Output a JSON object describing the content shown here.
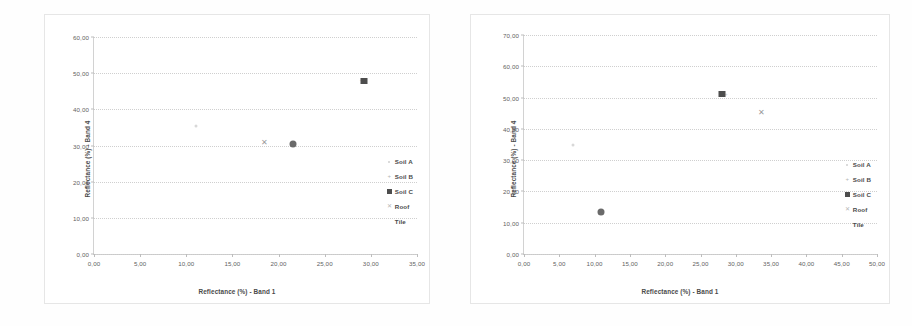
{
  "chart_data": [
    {
      "type": "scatter",
      "id": "left",
      "title": "",
      "xlabel": "Reflectance (%) - Band 1",
      "ylabel": "Reflectance (%) - Band 4",
      "xlim": [
        0,
        35
      ],
      "ylim": [
        0,
        60
      ],
      "xticks": [
        "0,00",
        "5,00",
        "10,00",
        "15,00",
        "20,00",
        "25,00",
        "30,00",
        "35,00"
      ],
      "xtick_values": [
        0,
        5,
        10,
        15,
        20,
        25,
        30,
        35
      ],
      "yticks": [
        "0,00",
        "10,00",
        "20,00",
        "30,00",
        "40,00",
        "50,00",
        "60,00"
      ],
      "ytick_values": [
        0,
        10,
        20,
        30,
        40,
        50,
        60
      ],
      "grid": "horizontal-dotted",
      "legend_position": "right-inside",
      "series": [
        {
          "name": "Soil A",
          "marker": "soil-a",
          "points": [
            [
              11.0,
              35.5
            ]
          ]
        },
        {
          "name": "Soil B",
          "marker": "soil-b",
          "points": [
            [
              29.0,
              48.2
            ]
          ]
        },
        {
          "name": "Soil C",
          "marker": "soil-c",
          "points": [
            [
              29.3,
              47.8
            ]
          ]
        },
        {
          "name": "Roof",
          "marker": "roof",
          "points": [
            [
              18.5,
              31.0
            ]
          ]
        },
        {
          "name": "Tile",
          "marker": "tile",
          "points": [
            [
              21.6,
              30.4
            ]
          ]
        }
      ]
    },
    {
      "type": "scatter",
      "id": "right",
      "title": "",
      "xlabel": "Reflectance (%) - Band 1",
      "ylabel": "Reflectance (%) - Band 4",
      "xlim": [
        0,
        50
      ],
      "ylim": [
        0,
        70
      ],
      "xticks": [
        "0,00",
        "5,00",
        "10,00",
        "15,00",
        "20,00",
        "25,00",
        "30,00",
        "35,00",
        "40,00",
        "45,00",
        "50,00"
      ],
      "xtick_values": [
        0,
        5,
        10,
        15,
        20,
        25,
        30,
        35,
        40,
        45,
        50
      ],
      "yticks": [
        "0,00",
        "10,00",
        "20,00",
        "30,00",
        "40,00",
        "50,00",
        "60,00",
        "70,00"
      ],
      "ytick_values": [
        0,
        10,
        20,
        30,
        40,
        50,
        60,
        70
      ],
      "grid": "horizontal-dotted",
      "legend_position": "right-inside",
      "series": [
        {
          "name": "Soil A",
          "marker": "soil-a",
          "points": [
            [
              7.0,
              35.0
            ]
          ]
        },
        {
          "name": "Soil B",
          "marker": "soil-b",
          "points": [
            [
              28.6,
              51.0
            ]
          ]
        },
        {
          "name": "Soil C",
          "marker": "soil-c",
          "points": [
            [
              28.0,
              51.2
            ]
          ]
        },
        {
          "name": "Roof",
          "marker": "roof",
          "points": [
            [
              33.6,
              45.5
            ]
          ]
        },
        {
          "name": "Tile",
          "marker": "tile",
          "points": [
            [
              10.9,
              13.5
            ]
          ]
        }
      ]
    }
  ],
  "legend_entries": [
    "Soil A",
    "Soil B",
    "Soil C",
    "Roof",
    "Tile"
  ],
  "colors": {
    "soil_a": "#d8d8d8",
    "soil_b": "#cccccc",
    "soil_c": "#4d4d4d",
    "roof": "#9a9a9a",
    "tile": "#6a6a6a",
    "grid": "#cfcfcf",
    "axis": "#bdbdbd",
    "text": "#4a4a4a",
    "background": "#ffffff"
  },
  "markers": {
    "soil_b_glyph": "+",
    "roof_glyph": "✕"
  }
}
